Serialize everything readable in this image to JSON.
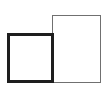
{
  "diagram": {
    "shapes": [
      {
        "id": "square-left",
        "type": "rectangle",
        "x": 7,
        "y": 33,
        "width": 47,
        "height": 50,
        "stroke": "#1e1e1e",
        "stroke_width": 3,
        "fill": "none"
      },
      {
        "id": "rect-right",
        "type": "rectangle",
        "x": 52,
        "y": 15,
        "width": 49,
        "height": 68,
        "stroke": "#707070",
        "stroke_width": 1,
        "fill": "#ffffff"
      }
    ]
  }
}
